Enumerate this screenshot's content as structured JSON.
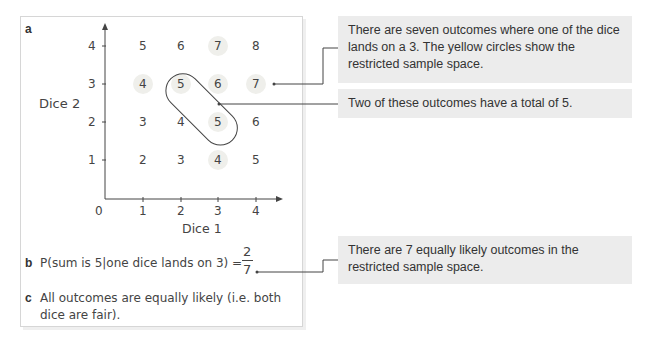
{
  "part_a": {
    "label": "a",
    "y_axis_label": "Dice 2",
    "x_axis_label": "Dice 1",
    "origin_label": "0",
    "x_ticks": [
      "1",
      "2",
      "3",
      "4"
    ],
    "y_ticks": [
      "1",
      "2",
      "3",
      "4"
    ]
  },
  "grid": {
    "rows": [
      {
        "dice2": "4",
        "sums": [
          "5",
          "6",
          "7",
          "8"
        ]
      },
      {
        "dice2": "3",
        "sums": [
          "4",
          "5",
          "6",
          "7"
        ]
      },
      {
        "dice2": "2",
        "sums": [
          "3",
          "4",
          "5",
          "6"
        ]
      },
      {
        "dice2": "1",
        "sums": [
          "2",
          "3",
          "4",
          "5"
        ]
      }
    ],
    "highlight_color": "#f0f0ec",
    "highlighted_cells": [
      [
        3,
        4
      ],
      [
        1,
        3
      ],
      [
        2,
        3
      ],
      [
        3,
        3
      ],
      [
        4,
        3
      ],
      [
        3,
        2
      ],
      [
        3,
        1
      ]
    ],
    "looped_cells": [
      [
        2,
        3
      ],
      [
        3,
        2
      ]
    ]
  },
  "part_b": {
    "label": "b",
    "expression": "P(sum is 5|one dice lands on 3) =",
    "numerator": "2",
    "denominator": "7"
  },
  "part_c": {
    "label": "c",
    "line1": "All outcomes are equally likely (i.e. both",
    "line2": "dice are fair)."
  },
  "callouts": [
    {
      "text": "There are seven outcomes where one of the dice lands on a 3. The yellow circles show the restricted sample space."
    },
    {
      "text": "Two of these outcomes have a total of 5."
    },
    {
      "text": "There are 7 equally likely outcomes in the restricted sample space."
    }
  ],
  "colors": {
    "callout_bg": "#ececec",
    "panel_border": "#d6d6d6",
    "line": "#444444"
  }
}
